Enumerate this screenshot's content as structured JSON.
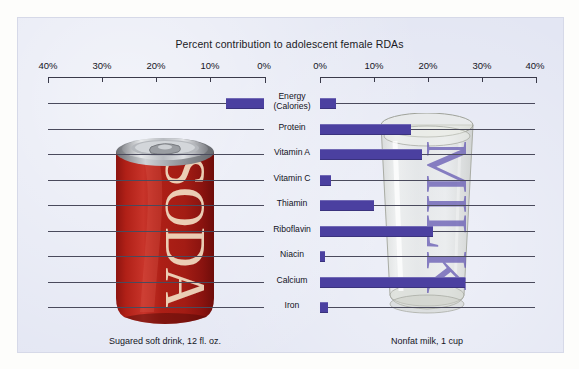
{
  "chart_data": {
    "type": "bar",
    "title": "Percent contribution to adolescent female RDAs",
    "subtitle": "",
    "xlabel": "",
    "ylabel": "",
    "orientation": "horizontal",
    "layout": "back-to-back pyramid (mirrored bars)",
    "grid": false,
    "legend_position": "none",
    "xlim": [
      0,
      40
    ],
    "axis_unit": "%",
    "left_axis_ticks": [
      "40%",
      "30%",
      "20%",
      "10%",
      "0%"
    ],
    "left_axis_tick_values": [
      40,
      30,
      20,
      10,
      0
    ],
    "right_axis_ticks": [
      "0%",
      "10%",
      "20%",
      "30%",
      "40%"
    ],
    "right_axis_tick_values": [
      0,
      10,
      20,
      30,
      40
    ],
    "categories": [
      "Energy\n(Calories)",
      "Protein",
      "Vitamin A",
      "Vitamin C",
      "Thiamin",
      "Riboflavin",
      "Niacin",
      "Calcium",
      "Iron"
    ],
    "series": [
      {
        "name": "Sugared soft drink, 12 fl. oz.",
        "side": "left",
        "values": [
          7,
          0,
          0,
          0,
          0,
          0,
          0,
          0,
          0
        ]
      },
      {
        "name": "Nonfat milk, 1 cup",
        "side": "right",
        "values": [
          3,
          17,
          19,
          2,
          10,
          21,
          1,
          27,
          1.5
        ]
      }
    ],
    "bar_color": "#4b40a0"
  },
  "header": {
    "title": "Percent contribution to adolescent female RDAs"
  },
  "axes": {
    "left": {
      "ticks": [
        {
          "label": "40%",
          "value": 40
        },
        {
          "label": "30%",
          "value": 30
        },
        {
          "label": "20%",
          "value": 20
        },
        {
          "label": "10%",
          "value": 10
        },
        {
          "label": "0%",
          "value": 0
        }
      ]
    },
    "right": {
      "ticks": [
        {
          "label": "0%",
          "value": 0
        },
        {
          "label": "10%",
          "value": 10
        },
        {
          "label": "20%",
          "value": 20
        },
        {
          "label": "30%",
          "value": 30
        },
        {
          "label": "40%",
          "value": 40
        }
      ]
    }
  },
  "rows": [
    {
      "label": "Energy\n(Calories)",
      "left": 7,
      "right": 3
    },
    {
      "label": "Protein",
      "left": 0,
      "right": 17
    },
    {
      "label": "Vitamin A",
      "left": 0,
      "right": 19
    },
    {
      "label": "Vitamin C",
      "left": 0,
      "right": 2
    },
    {
      "label": "Thiamin",
      "left": 0,
      "right": 10
    },
    {
      "label": "Riboflavin",
      "left": 0,
      "right": 21
    },
    {
      "label": "Niacin",
      "left": 0,
      "right": 1
    },
    {
      "label": "Calcium",
      "left": 0,
      "right": 27
    },
    {
      "label": "Iron",
      "left": 0,
      "right": 1.5
    }
  ],
  "captions": {
    "left": "Sugared soft drink, 12 fl. oz.",
    "right": "Nonfat milk, 1 cup"
  },
  "artwork": {
    "soda_label_text": "SODA",
    "glass_label_text": "MILK"
  },
  "colors": {
    "bar": "#4b40a0",
    "panel_background": "#e3e6f3",
    "page_background": "#fdfdfb",
    "leader_line": "#4a4a5c",
    "soda_can_red": "#b42019",
    "glass_tint": "#d9dbd4"
  }
}
